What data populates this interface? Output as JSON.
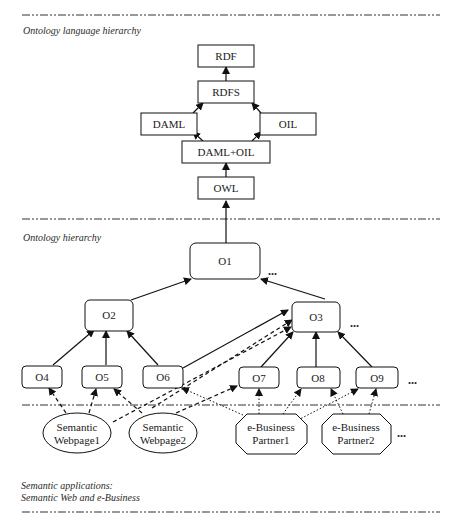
{
  "sections": {
    "language": {
      "label": "Ontology language hierarchy"
    },
    "ontology": {
      "label": "Ontology hierarchy"
    },
    "applications": {
      "label_line1": "Semantic applications:",
      "label_line2": "Semantic Web and e-Business"
    }
  },
  "language_nodes": {
    "rdf": "RDF",
    "rdfs": "RDFS",
    "daml": "DAML",
    "oil": "OIL",
    "daml_oil": "DAML+OIL",
    "owl": "OWL"
  },
  "ontology_nodes": {
    "o1": "O1",
    "o2": "O2",
    "o3": "O3",
    "o4": "O4",
    "o5": "O5",
    "o6": "O6",
    "o7": "O7",
    "o8": "O8",
    "o9": "O9"
  },
  "application_nodes": {
    "webpage1_line1": "Semantic",
    "webpage1_line2": "Webpage1",
    "webpage2_line1": "Semantic",
    "webpage2_line2": "Webpage2",
    "partner1_line1": "e-Business",
    "partner1_line2": "Partner1",
    "partner2_line1": "e-Business",
    "partner2_line2": "Partner2"
  },
  "ellipsis": "...",
  "edges": [
    {
      "from": "RDFS",
      "to": "RDF",
      "style": "solid"
    },
    {
      "from": "DAML",
      "to": "RDFS",
      "style": "solid"
    },
    {
      "from": "OIL",
      "to": "RDFS",
      "style": "solid"
    },
    {
      "from": "DAML+OIL",
      "to": "DAML",
      "style": "solid"
    },
    {
      "from": "DAML+OIL",
      "to": "OIL",
      "style": "solid"
    },
    {
      "from": "OWL",
      "to": "DAML+OIL",
      "style": "solid"
    },
    {
      "from": "O1",
      "to": "OWL",
      "style": "solid"
    },
    {
      "from": "O2",
      "to": "O1",
      "style": "solid"
    },
    {
      "from": "O3",
      "to": "O1",
      "style": "solid"
    },
    {
      "from": "O4",
      "to": "O2",
      "style": "solid"
    },
    {
      "from": "O5",
      "to": "O2",
      "style": "solid"
    },
    {
      "from": "O6",
      "to": "O2",
      "style": "solid"
    },
    {
      "from": "O6",
      "to": "O3",
      "style": "solid"
    },
    {
      "from": "O7",
      "to": "O3",
      "style": "solid"
    },
    {
      "from": "O8",
      "to": "O3",
      "style": "solid"
    },
    {
      "from": "O9",
      "to": "O3",
      "style": "solid"
    },
    {
      "from": "Semantic Webpage1",
      "to": "O4",
      "style": "dashed"
    },
    {
      "from": "Semantic Webpage1",
      "to": "O5",
      "style": "dashed"
    },
    {
      "from": "Semantic Webpage1",
      "to": "O3",
      "style": "dashed"
    },
    {
      "from": "Semantic Webpage2",
      "to": "O5",
      "style": "dashed"
    },
    {
      "from": "Semantic Webpage2",
      "to": "O7",
      "style": "dashed"
    },
    {
      "from": "Semantic Webpage2",
      "to": "O3",
      "style": "dashed"
    },
    {
      "from": "e-Business Partner1",
      "to": "O6",
      "style": "dotted"
    },
    {
      "from": "e-Business Partner1",
      "to": "O7",
      "style": "dotted"
    },
    {
      "from": "e-Business Partner1",
      "to": "O8",
      "style": "dotted"
    },
    {
      "from": "e-Business Partner1",
      "to": "O9",
      "style": "dotted"
    },
    {
      "from": "e-Business Partner2",
      "to": "O8",
      "style": "dotted"
    },
    {
      "from": "e-Business Partner2",
      "to": "O9",
      "style": "dotted"
    }
  ]
}
